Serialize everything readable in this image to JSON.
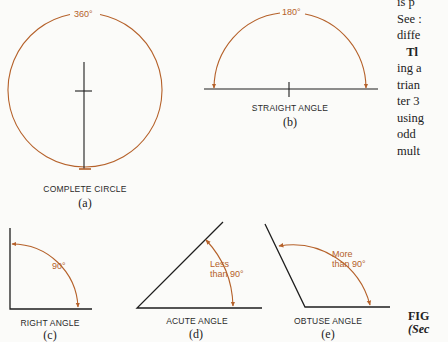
{
  "figure": {
    "panels": [
      {
        "id": "a",
        "label": "COMPLETE CIRCLE",
        "sub": "(a)",
        "angle_text": "360°"
      },
      {
        "id": "b",
        "label": "STRAIGHT ANGLE",
        "sub": "(b)",
        "angle_text": "180°"
      },
      {
        "id": "c",
        "label": "RIGHT ANGLE",
        "sub": "(c)",
        "angle_text": "90°"
      },
      {
        "id": "d",
        "label": "ACUTE ANGLE",
        "sub": "(d)",
        "angle_text_line1": "Less",
        "angle_text_line2": "than 90°"
      },
      {
        "id": "e",
        "label": "OBTUSE ANGLE",
        "sub": "(e)",
        "angle_text_line1": "More",
        "angle_text_line2": "than 90°"
      }
    ],
    "caption_line1": "FIG",
    "caption_line2": "(Sec"
  },
  "body_text": {
    "lines": [
      "is p",
      "See :",
      "diffe",
      "   Tl",
      "ing a",
      "trian",
      "ter 3",
      "using",
      "odd",
      "mult"
    ]
  },
  "colors": {
    "arc": "#b5612a",
    "ink": "#1e1e1e",
    "background": "#fbfbf9"
  }
}
